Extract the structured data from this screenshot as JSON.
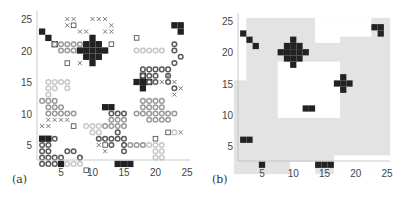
{
  "figure": {
    "panels": [
      {
        "label": "(a)",
        "type": "marker_grid"
      },
      {
        "label": "(b)",
        "type": "binary_grid"
      }
    ]
  },
  "colors": {
    "obstacle": "#222222",
    "covered": "#e3e3e3",
    "marker_light": "#c8c8c8",
    "marker_mid": "#9a9a9a",
    "marker_dark": "#5a5a5a",
    "axis": "#bbbbbb",
    "tick_text": "#444444"
  },
  "chart_data": [
    {
      "type": "scatter",
      "title": "",
      "panel_label": "(a)",
      "xlabel": "",
      "ylabel": "",
      "xlim": [
        1,
        25
      ],
      "ylim": [
        1,
        25
      ],
      "xticks": [
        "5",
        "10",
        "15",
        "20",
        "25"
      ],
      "yticks": [
        "5",
        "10",
        "15",
        "20",
        "25"
      ],
      "grid": false,
      "legend": null,
      "series": [
        {
          "name": "obstacles",
          "marker": "filled-square",
          "color": "#222222",
          "points": [
            [
              2,
              23
            ],
            [
              3,
              22
            ],
            [
              4,
              21
            ],
            [
              10,
              22
            ],
            [
              9,
              21
            ],
            [
              10,
              21
            ],
            [
              11,
              21
            ],
            [
              8,
              20
            ],
            [
              9,
              20
            ],
            [
              10,
              20
            ],
            [
              11,
              20
            ],
            [
              12,
              20
            ],
            [
              9,
              19
            ],
            [
              10,
              19
            ],
            [
              11,
              19
            ],
            [
              10,
              18
            ],
            [
              23,
              24
            ],
            [
              24,
              24
            ],
            [
              24,
              23
            ],
            [
              18,
              16
            ],
            [
              17,
              15
            ],
            [
              18,
              15
            ],
            [
              19,
              15
            ],
            [
              18,
              14
            ],
            [
              12,
              11
            ],
            [
              13,
              11
            ],
            [
              2,
              6
            ],
            [
              3,
              6
            ],
            [
              5,
              2
            ],
            [
              14,
              2
            ],
            [
              15,
              2
            ],
            [
              16,
              2
            ]
          ]
        },
        {
          "name": "light-circles",
          "marker": "ring",
          "color": "#c8c8c8",
          "points": [
            [
              3,
              15
            ],
            [
              4,
              15
            ],
            [
              5,
              15
            ],
            [
              6,
              15
            ],
            [
              3,
              14
            ],
            [
              4,
              14
            ],
            [
              6,
              14
            ],
            [
              3,
              13
            ],
            [
              17,
              20
            ],
            [
              18,
              20
            ],
            [
              19,
              20
            ],
            [
              20,
              20
            ],
            [
              21,
              20
            ],
            [
              9,
              8
            ],
            [
              10,
              8
            ],
            [
              11,
              8
            ],
            [
              10,
              7
            ],
            [
              11,
              7
            ],
            [
              18,
              5
            ],
            [
              19,
              5
            ],
            [
              20,
              5
            ],
            [
              21,
              5
            ],
            [
              20,
              4
            ],
            [
              21,
              4
            ],
            [
              20,
              3
            ],
            [
              21,
              3
            ],
            [
              7,
              2
            ],
            [
              8,
              2
            ],
            [
              6,
              2
            ],
            [
              23,
              7
            ]
          ]
        },
        {
          "name": "mid-circles",
          "marker": "ring",
          "color": "#9a9a9a",
          "points": [
            [
              4,
              21
            ],
            [
              5,
              21
            ],
            [
              6,
              21
            ],
            [
              7,
              21
            ],
            [
              8,
              21
            ],
            [
              5,
              20
            ],
            [
              6,
              20
            ],
            [
              7,
              20
            ],
            [
              2,
              12
            ],
            [
              3,
              12
            ],
            [
              4,
              12
            ],
            [
              3,
              11
            ],
            [
              4,
              11
            ],
            [
              5,
              11
            ],
            [
              6,
              10
            ],
            [
              5,
              10
            ],
            [
              4,
              10
            ],
            [
              3,
              10
            ],
            [
              7,
              10
            ],
            [
              21,
              12
            ],
            [
              20,
              12
            ],
            [
              19,
              12
            ],
            [
              18,
              12
            ],
            [
              21,
              11
            ],
            [
              20,
              11
            ],
            [
              19,
              11
            ],
            [
              18,
              11
            ],
            [
              23,
              10
            ],
            [
              22,
              10
            ],
            [
              21,
              10
            ],
            [
              20,
              10
            ],
            [
              19,
              10
            ],
            [
              18,
              10
            ],
            [
              17,
              10
            ],
            [
              22,
              9
            ],
            [
              21,
              9
            ],
            [
              20,
              9
            ],
            [
              19,
              9
            ],
            [
              13,
              9
            ],
            [
              14,
              9
            ],
            [
              15,
              9
            ],
            [
              12,
              8
            ],
            [
              13,
              8
            ],
            [
              14,
              8
            ],
            [
              15,
              8
            ],
            [
              16,
              5
            ],
            [
              17,
              5
            ],
            [
              18,
              5
            ]
          ]
        },
        {
          "name": "dark-circles",
          "marker": "ring",
          "color": "#5a5a5a",
          "points": [
            [
              18,
              17
            ],
            [
              19,
              17
            ],
            [
              20,
              17
            ],
            [
              21,
              17
            ],
            [
              22,
              17
            ],
            [
              18,
              16
            ],
            [
              19,
              16
            ],
            [
              20,
              16
            ],
            [
              19,
              15
            ],
            [
              20,
              15
            ],
            [
              23,
              21
            ],
            [
              23,
              20
            ],
            [
              24,
              19
            ],
            [
              23,
              18
            ],
            [
              22,
              16
            ],
            [
              22,
              15
            ],
            [
              23,
              14
            ],
            [
              14,
              10
            ],
            [
              13,
              10
            ],
            [
              15,
              10
            ],
            [
              14,
              7
            ],
            [
              13,
              6
            ],
            [
              14,
              6
            ],
            [
              15,
              6
            ],
            [
              12,
              6
            ],
            [
              13,
              5
            ],
            [
              15,
              5
            ],
            [
              15,
              4
            ],
            [
              2,
              5
            ],
            [
              3,
              5
            ],
            [
              2,
              4
            ],
            [
              3,
              4
            ],
            [
              2,
              3
            ],
            [
              3,
              3
            ],
            [
              4,
              3
            ],
            [
              2,
              2
            ],
            [
              3,
              2
            ],
            [
              4,
              2
            ],
            [
              5,
              3
            ],
            [
              6,
              4
            ],
            [
              7,
              4
            ],
            [
              8,
              3
            ],
            [
              4,
              6
            ],
            [
              11,
              6
            ]
          ]
        },
        {
          "name": "crosses",
          "marker": "x",
          "color": "#7a7a7a",
          "points": [
            [
              6,
              25
            ],
            [
              7,
              25
            ],
            [
              6,
              24
            ],
            [
              7,
              24
            ],
            [
              8,
              23
            ],
            [
              9,
              23
            ],
            [
              10,
              25
            ],
            [
              11,
              25
            ],
            [
              12,
              25
            ],
            [
              13,
              24
            ],
            [
              12,
              23
            ],
            [
              13,
              23
            ],
            [
              3,
              9
            ],
            [
              4,
              9
            ],
            [
              5,
              9
            ],
            [
              6,
              9
            ],
            [
              2,
              8
            ],
            [
              3,
              8
            ],
            [
              22,
              16
            ],
            [
              23,
              15
            ],
            [
              21,
              15
            ],
            [
              24,
              14
            ],
            [
              23,
              13
            ],
            [
              24,
              7
            ],
            [
              11,
              5
            ],
            [
              12,
              4
            ],
            [
              8,
              18
            ]
          ]
        },
        {
          "name": "open-squares",
          "marker": "open-square",
          "color": "#555555",
          "points": [
            [
              17,
              22
            ],
            [
              13,
              21
            ],
            [
              6,
              18
            ],
            [
              7,
              8
            ],
            [
              20,
              6
            ],
            [
              22,
              7
            ],
            [
              9,
              1
            ],
            [
              12,
              5
            ],
            [
              7,
              24
            ]
          ]
        }
      ]
    },
    {
      "type": "heatmap",
      "title": "",
      "panel_label": "(b)",
      "xlabel": "",
      "ylabel": "",
      "xlim": [
        1,
        25
      ],
      "ylim": [
        1,
        25
      ],
      "xticks": [
        "5",
        "10",
        "15",
        "20",
        "25"
      ],
      "yticks": [
        "5",
        "10",
        "15",
        "20",
        "25"
      ],
      "grid": false,
      "legend": null,
      "levels": {
        "0": "uncovered (white)",
        "1": "covered (light grey)",
        "2": "obstacle (black)"
      },
      "obstacles": [
        [
          2,
          23
        ],
        [
          3,
          22
        ],
        [
          4,
          21
        ],
        [
          10,
          22
        ],
        [
          9,
          21
        ],
        [
          10,
          21
        ],
        [
          11,
          21
        ],
        [
          8,
          20
        ],
        [
          9,
          20
        ],
        [
          10,
          20
        ],
        [
          11,
          20
        ],
        [
          12,
          20
        ],
        [
          9,
          19
        ],
        [
          10,
          19
        ],
        [
          11,
          19
        ],
        [
          10,
          18
        ],
        [
          23,
          24
        ],
        [
          24,
          24
        ],
        [
          24,
          23
        ],
        [
          18,
          16
        ],
        [
          17,
          15
        ],
        [
          18,
          15
        ],
        [
          19,
          15
        ],
        [
          18,
          14
        ],
        [
          12,
          11
        ],
        [
          13,
          11
        ],
        [
          2,
          6
        ],
        [
          3,
          6
        ],
        [
          5,
          2
        ],
        [
          14,
          2
        ],
        [
          15,
          2
        ],
        [
          16,
          2
        ]
      ],
      "uncovered_regions": [
        {
          "desc": "central white region",
          "cells_x": [
            8,
            17
          ],
          "cells_y": [
            10,
            18
          ]
        },
        {
          "desc": "upper right notch",
          "cells_x": [
            14,
            17
          ],
          "cells_y": [
            22,
            25
          ]
        },
        {
          "desc": "top-right gap",
          "cells_x": [
            17,
            22
          ],
          "cells_y": [
            23,
            25
          ]
        },
        {
          "desc": "bottom white strip",
          "cells_x": [
            10,
            13
          ],
          "cells_y": [
            1,
            2
          ]
        },
        {
          "desc": "bottom-right white",
          "cells_x": [
            17,
            25
          ],
          "cells_y": [
            1,
            3
          ]
        },
        {
          "desc": "left top white",
          "cells_x": [
            1,
            2
          ],
          "cells_y": [
            16,
            25
          ]
        }
      ]
    }
  ]
}
